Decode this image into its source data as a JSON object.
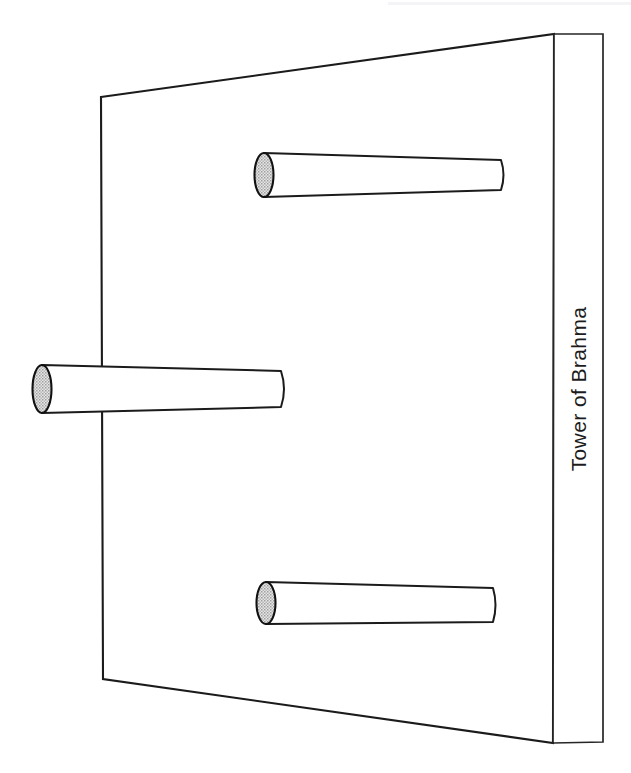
{
  "figure": {
    "title_label": "Tower of Brahma",
    "background_color": "#ffffff",
    "line_color": "#1b1b1b",
    "cap_fill_color": "#cfcfcf",
    "panel": {
      "name": "board-panel",
      "corners": {
        "top_left": [
          101,
          97
        ],
        "top_right": [
          554,
          34
        ],
        "bottom_right": [
          553,
          743
        ],
        "bottom_left": [
          103,
          679
        ]
      }
    },
    "side_strip": {
      "name": "board-side-strip",
      "corners": {
        "top_left": [
          554,
          34
        ],
        "top_right": [
          603,
          34
        ],
        "bottom_right": [
          603,
          742
        ],
        "bottom_left": [
          553,
          743
        ]
      }
    },
    "pegs": [
      {
        "name": "peg-top",
        "position": "top",
        "cap_center": [
          264,
          175
        ],
        "cap_rx": 9.5,
        "cap_ry": 22,
        "far_end_x": 501,
        "far_end_top_y": 160,
        "far_end_bottom_y": 190
      },
      {
        "name": "peg-middle",
        "position": "middle",
        "cap_center": [
          42,
          389
        ],
        "cap_rx": 9.5,
        "cap_ry": 24,
        "far_end_x": 281,
        "far_end_top_y": 371,
        "far_end_bottom_y": 407
      },
      {
        "name": "peg-bottom",
        "position": "bottom",
        "cap_center": [
          266,
          603
        ],
        "cap_rx": 9.5,
        "cap_ry": 21,
        "far_end_x": 493,
        "far_end_top_y": 588,
        "far_end_bottom_y": 622
      }
    ]
  }
}
